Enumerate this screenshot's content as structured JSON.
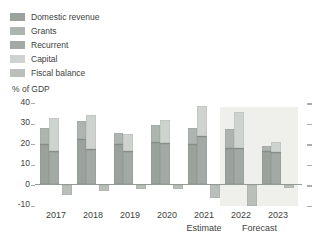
{
  "legend": {
    "items": [
      {
        "label": "Domestic revenue",
        "color_key": "domestic_revenue"
      },
      {
        "label": "Grants",
        "color_key": "grants"
      },
      {
        "label": "Recurrent",
        "color_key": "recurrent"
      },
      {
        "label": "Capital",
        "color_key": "capital"
      },
      {
        "label": "Fiscal balance",
        "color_key": "fiscal_balance"
      }
    ]
  },
  "colors": {
    "domestic_revenue": "#9ba29c",
    "grants": "#aeb4af",
    "recurrent": "#a3a9a4",
    "capital": "#cfd3cf",
    "fiscal_balance": "#babfba",
    "divider": "#868c87",
    "axis": "#949a94",
    "tick": "#a8aea9",
    "text": "#3e4240",
    "forecast_band": "#efefec"
  },
  "chart_data": {
    "type": "bar",
    "subtype": "grouped-stacked-with-balance",
    "unit_label": "% of GDP",
    "categories": [
      "2017",
      "2018",
      "2019",
      "2020",
      "2021",
      "2022",
      "2023"
    ],
    "series": [
      {
        "name": "Domestic revenue",
        "stack": "revenue",
        "color_key": "domestic_revenue",
        "values": [
          19,
          21.5,
          19,
          20,
          19,
          17,
          15.5
        ]
      },
      {
        "name": "Grants",
        "stack": "revenue",
        "color_key": "grants",
        "values": [
          8.5,
          9,
          6,
          9,
          8.5,
          10,
          3
        ]
      },
      {
        "name": "Recurrent",
        "stack": "expenditure",
        "color_key": "recurrent",
        "values": [
          15.5,
          16.5,
          15.5,
          19.5,
          23,
          17,
          15
        ]
      },
      {
        "name": "Capital",
        "stack": "expenditure",
        "color_key": "capital",
        "values": [
          16.5,
          17,
          9,
          11.5,
          15,
          18,
          5.5
        ]
      },
      {
        "name": "Fiscal balance",
        "stack": "balance",
        "color_key": "fiscal_balance",
        "values": [
          -5,
          -3,
          -2,
          -2,
          -6.5,
          -10,
          -1.5
        ]
      }
    ],
    "yticks": [
      40,
      30,
      20,
      10,
      0,
      -10
    ],
    "ylim": [
      -12,
      41
    ],
    "grid": false,
    "legend_position": "top-left",
    "annotations": [
      {
        "text": "Estimate",
        "under_categories": [
          "2021"
        ]
      },
      {
        "text": "Forecast",
        "under_categories": [
          "2022",
          "2023"
        ]
      }
    ],
    "forecast_band_categories": [
      "2022",
      "2023"
    ]
  }
}
